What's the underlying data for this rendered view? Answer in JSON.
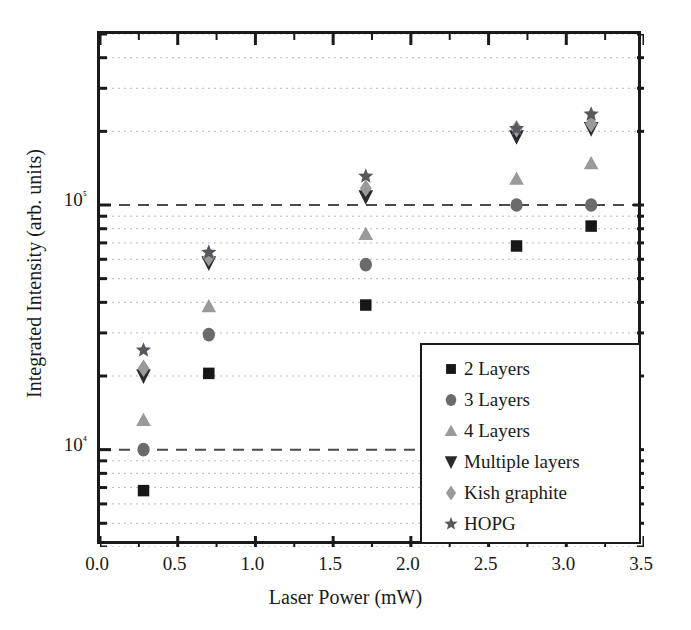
{
  "chart_data": {
    "type": "scatter",
    "title": "",
    "xlabel": "Laser Power (mW)",
    "ylabel": "Integrated Intensity (arb. units)",
    "xlim": [
      0.0,
      3.5
    ],
    "ylim": [
      4000,
      500000
    ],
    "yscale": "log",
    "xscale": "linear",
    "grid": true,
    "grid_style": "dotted minor gridlines, dashed major decade lines",
    "legend_position": "lower right (inside axes)",
    "xticks": [
      "0.0",
      "0.5",
      "1.0",
      "1.5",
      "2.0",
      "2.5",
      "3.0",
      "3.5"
    ],
    "xtick_values": [
      0.0,
      0.5,
      1.0,
      1.5,
      2.0,
      2.5,
      3.0,
      3.5
    ],
    "yticks": [
      "10⁴",
      "10⁵"
    ],
    "ytick_values": [
      10000,
      100000
    ],
    "x": [
      0.28,
      0.7,
      1.71,
      2.68,
      3.16
    ],
    "series": [
      {
        "name": "2 Layers",
        "marker": "square",
        "color": "#17171a",
        "values": [
          6800,
          20500,
          39000,
          68000,
          82000
        ]
      },
      {
        "name": "3 Layers",
        "marker": "circle",
        "color": "#6b6b6e",
        "values": [
          10000,
          29500,
          57000,
          100000,
          100000
        ]
      },
      {
        "name": "4 Layers",
        "marker": "triangle-up",
        "color": "#9a9a9c",
        "values": [
          13200,
          38500,
          76000,
          128000,
          148000
        ]
      },
      {
        "name": "Multiple layers",
        "marker": "triangle-down",
        "color": "#2b2b2f",
        "values": [
          20000,
          58000,
          108000,
          190000,
          205000
        ]
      },
      {
        "name": "Kish graphite",
        "marker": "diamond",
        "color": "#9a9a9c",
        "values": [
          21500,
          61000,
          117000,
          205000,
          215000
        ]
      },
      {
        "name": "HOPG",
        "marker": "star",
        "color": "#59595d",
        "values": [
          25500,
          64000,
          131000,
          205000,
          235000
        ]
      }
    ]
  },
  "legend": {
    "entries": [
      {
        "label": "2 Layers",
        "icon": "square-marker-icon"
      },
      {
        "label": "3 Layers",
        "icon": "circle-marker-icon"
      },
      {
        "label": "4 Layers",
        "icon": "triangle-up-marker-icon"
      },
      {
        "label": "Multiple layers",
        "icon": "triangle-down-marker-icon"
      },
      {
        "label": "Kish graphite",
        "icon": "diamond-marker-icon"
      },
      {
        "label": "HOPG",
        "icon": "star-marker-icon"
      }
    ]
  },
  "colors": {
    "axis": "#1a1a1a",
    "major_gridline": "#4a4a4a",
    "minor_gridline": "#b9b9b9",
    "background": "#ffffff"
  }
}
